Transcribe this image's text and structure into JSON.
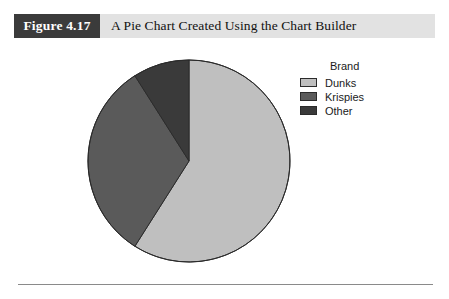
{
  "figure": {
    "number_label": "Figure 4.17",
    "caption": "A Pie Chart Created Using the Chart Builder"
  },
  "legend": {
    "title": "Brand",
    "entries": [
      {
        "label": "Dunks",
        "color": "#bfbfbf"
      },
      {
        "label": "Krispies",
        "color": "#5a5a5a"
      },
      {
        "label": "Other",
        "color": "#3a3a3a"
      }
    ]
  },
  "chart_data": {
    "type": "pie",
    "title": "",
    "legend_title": "Brand",
    "legend_position": "right",
    "categories": [
      "Dunks",
      "Krispies",
      "Other"
    ],
    "values": [
      59,
      32,
      9
    ],
    "unit": "percent",
    "colors": [
      "#bfbfbf",
      "#5a5a5a",
      "#3a3a3a"
    ],
    "start_angle_deg": 0,
    "direction": "clockwise",
    "slice_angles_deg": [
      212.4,
      115.2,
      32.4
    ],
    "slice_boundaries_deg": [
      0,
      212.4,
      327.6,
      360
    ],
    "stroke_color": "#2b2b2b",
    "grid": false
  },
  "geometry": {
    "pie_center_x": 103,
    "pie_center_y": 103,
    "pie_radius": 101
  }
}
